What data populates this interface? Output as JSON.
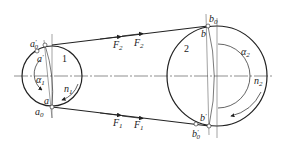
{
  "diagram": {
    "type": "belt-drive",
    "small_pulley": {
      "number": "1",
      "speed_label": "n",
      "speed_sub": "1",
      "wrap_angle_label": "α",
      "wrap_angle_sub": "1",
      "points": {
        "a0_prime": {
          "base": "a",
          "sub": "0",
          "sup": "'"
        },
        "a_prime": {
          "base": "a",
          "sup": "'"
        },
        "a": {
          "base": "a"
        },
        "a0": {
          "base": "a",
          "sub": "0"
        }
      }
    },
    "large_pulley": {
      "number": "2",
      "speed_label": "n",
      "speed_sub": "2",
      "wrap_angle_label": "α",
      "wrap_angle_sub": "2",
      "points": {
        "b0": {
          "base": "b",
          "sub": "0"
        },
        "b": {
          "base": "b"
        },
        "b_prime": {
          "base": "b",
          "sup": "'"
        },
        "b0_prime": {
          "base": "b",
          "sub": "0",
          "sup": "'"
        }
      }
    },
    "forces": {
      "top_left": {
        "base": "F",
        "sub": "2"
      },
      "top_right": {
        "base": "F",
        "sub": "2"
      },
      "bottom_left": {
        "base": "F",
        "sub": "1"
      },
      "bottom_right": {
        "base": "F",
        "sub": "1"
      }
    },
    "colors": {
      "line": "#222222",
      "background": "#ffffff"
    }
  }
}
